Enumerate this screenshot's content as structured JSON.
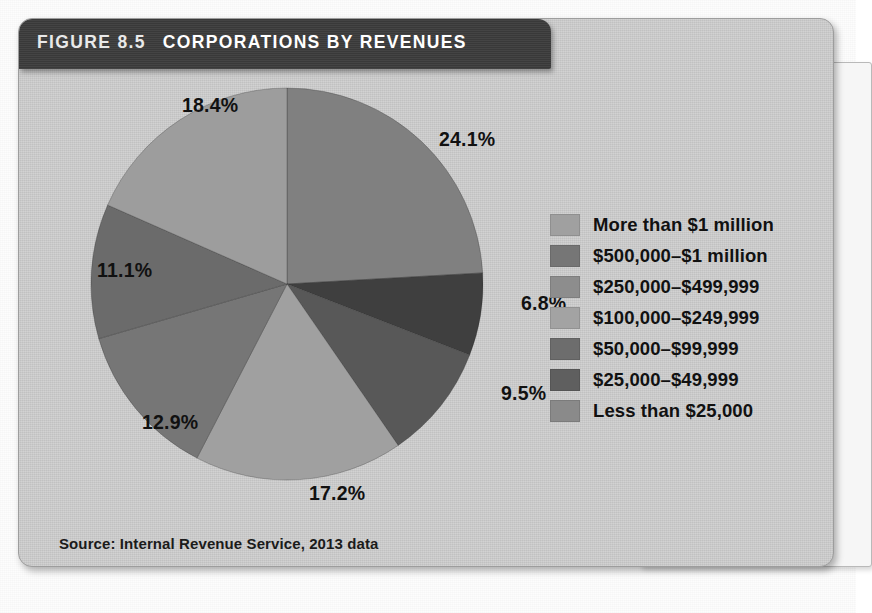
{
  "figure": {
    "label": "FIGURE 8.5",
    "title": "CORPORATIONS BY REVENUES",
    "source": "Source: Internal Revenue Service, 2013 data"
  },
  "chart_data": {
    "type": "pie",
    "title": "CORPORATIONS BY REVENUES",
    "xlabel": "",
    "ylabel": "",
    "legend_position": "right",
    "grid": false,
    "categories": [
      "More than $1 million",
      "$500,000–$1 million",
      "$250,000–$499,999",
      "$100,000–$249,999",
      "$50,000–$99,999",
      "$25,000–$49,999",
      "Less than $25,000"
    ],
    "values": [
      24.1,
      6.8,
      9.5,
      17.2,
      12.9,
      11.1,
      18.4
    ],
    "value_labels": [
      "24.1%",
      "6.8%",
      "9.5%",
      "17.2%",
      "12.9%",
      "11.1%",
      "18.4%"
    ],
    "colors": [
      "#808080",
      "#3f3f3f",
      "#585858",
      "#a0a0a0",
      "#767676",
      "#6b6b6b",
      "#9d9d9d"
    ],
    "unit": "%",
    "total": 100.0,
    "slices": [
      {
        "label": "More than $1 million",
        "value": 24.1,
        "display": "24.1%",
        "color": "#808080"
      },
      {
        "label": "$500,000–$1 million",
        "value": 6.8,
        "display": "6.8%",
        "color": "#3f3f3f"
      },
      {
        "label": "$250,000–$499,999",
        "value": 9.5,
        "display": "9.5%",
        "color": "#585858"
      },
      {
        "label": "$100,000–$249,999",
        "value": 17.2,
        "display": "17.2%",
        "color": "#a0a0a0"
      },
      {
        "label": "$50,000–$99,999",
        "value": 12.9,
        "display": "12.9%",
        "color": "#767676"
      },
      {
        "label": "$25,000–$49,999",
        "value": 11.1,
        "display": "11.1%",
        "color": "#6b6b6b"
      },
      {
        "label": "Less than $25,000",
        "value": 18.4,
        "display": "18.4%",
        "color": "#9d9d9d"
      }
    ]
  },
  "legend": [
    {
      "label": "More than $1 million",
      "color": "#a0a0a0"
    },
    {
      "label": "$500,000–$1 million",
      "color": "#767676"
    },
    {
      "label": "$250,000–$499,999",
      "color": "#8d8d8d"
    },
    {
      "label": "$100,000–$249,999",
      "color": "#a3a3a3"
    },
    {
      "label": "$50,000–$99,999",
      "color": "#6d6d6d"
    },
    {
      "label": "$25,000–$49,999",
      "color": "#5f5f5f"
    },
    {
      "label": "Less than $25,000",
      "color": "#8a8a8a"
    }
  ],
  "pct_labels": [
    {
      "text": "24.1%",
      "x": 352,
      "y": 44
    },
    {
      "text": "6.8%",
      "x": 434,
      "y": 208
    },
    {
      "text": "9.5%",
      "x": 414,
      "y": 298
    },
    {
      "text": "17.2%",
      "x": 222,
      "y": 398
    },
    {
      "text": "12.9%",
      "x": 55,
      "y": 327
    },
    {
      "text": "11.1%",
      "x": 10,
      "y": 175
    },
    {
      "text": "18.4%",
      "x": 95,
      "y": 10
    }
  ]
}
